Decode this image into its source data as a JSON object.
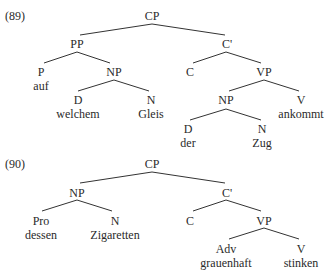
{
  "examples": [
    {
      "number": "(89)",
      "nodes": {
        "cp": "CP",
        "pp": "PP",
        "cbar": "C'",
        "p": "P",
        "np1": "NP",
        "c": "C",
        "vp": "VP",
        "d1": "D",
        "n1": "N",
        "np2": "NP",
        "v": "V",
        "d2": "D",
        "n2": "N"
      },
      "words": {
        "p": "auf",
        "d1": "welchem",
        "n1": "Gleis",
        "v": "ankommt",
        "d2": "der",
        "n2": "Zug"
      }
    },
    {
      "number": "(90)",
      "nodes": {
        "cp": "CP",
        "np": "NP",
        "cbar": "C'",
        "pro": "Pro",
        "n": "N",
        "c": "C",
        "vp": "VP",
        "adv": "Adv",
        "v": "V"
      },
      "words": {
        "pro": "dessen",
        "n": "Zigaretten",
        "adv": "grauenhaft",
        "v": "stinken"
      }
    }
  ],
  "colors": {
    "line": "#333333",
    "text": "#2a2a2a",
    "background": "#ffffff"
  }
}
